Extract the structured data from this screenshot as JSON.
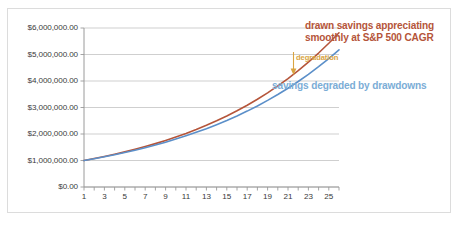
{
  "chart_data": {
    "type": "line",
    "title": "",
    "xlabel": "",
    "ylabel": "",
    "xlim": [
      1,
      26
    ],
    "ylim": [
      0,
      6000000
    ],
    "grid": true,
    "legend_position": "none",
    "y_ticks": [
      0,
      1000000,
      2000000,
      3000000,
      4000000,
      5000000,
      6000000
    ],
    "y_tick_labels": [
      "$0.00",
      "$1,000,000.00",
      "$2,000,000.00",
      "$3,000,000.00",
      "$4,000,000.00",
      "$5,000,000.00",
      "$6,000,000.00"
    ],
    "x_ticks": [
      1,
      2,
      3,
      4,
      5,
      6,
      7,
      8,
      9,
      10,
      11,
      12,
      13,
      14,
      15,
      16,
      17,
      18,
      19,
      20,
      21,
      22,
      23,
      24,
      25,
      26
    ],
    "x_tick_labels": [
      "1",
      "3",
      "5",
      "7",
      "9",
      "11",
      "13",
      "15",
      "17",
      "19",
      "21",
      "23",
      "25"
    ],
    "x_tick_label_values": [
      1,
      3,
      5,
      7,
      9,
      11,
      13,
      15,
      17,
      19,
      21,
      23,
      25
    ],
    "series": [
      {
        "name": "drawn savings appreciating smoothly at S&P 500 CAGR",
        "color": "#b5553a",
        "x": [
          1,
          2,
          3,
          4,
          5,
          6,
          7,
          8,
          9,
          10,
          11,
          12,
          13,
          14,
          15,
          16,
          17,
          18,
          19,
          20,
          21,
          22,
          23,
          24,
          25,
          26
        ],
        "values": [
          1000000,
          1073000,
          1151300,
          1235300,
          1325500,
          1422200,
          1526000,
          1637400,
          1757000,
          1885300,
          2023000,
          2170600,
          2329000,
          2499000,
          2681400,
          2877200,
          3087200,
          3312500,
          3554300,
          3813700,
          4092100,
          4390800,
          4711300,
          5055200,
          5424200,
          5820100
        ]
      },
      {
        "name": "savings degraded by drawdowns",
        "color": "#5b8fc9",
        "x": [
          1,
          2,
          3,
          4,
          5,
          6,
          7,
          8,
          9,
          10,
          11,
          12,
          13,
          14,
          15,
          16,
          17,
          18,
          19,
          20,
          21,
          22,
          23,
          24,
          25,
          26
        ],
        "values": [
          1000000,
          1068000,
          1140600,
          1218200,
          1301000,
          1389500,
          1483900,
          1584800,
          1692500,
          1807600,
          1930500,
          2061700,
          2201900,
          2351600,
          2511500,
          2682300,
          2864700,
          3059400,
          3267400,
          3489500,
          3726800,
          3980200,
          4250700,
          4539600,
          4848000,
          5177000
        ]
      }
    ],
    "annotations": [
      {
        "id": "drawn-savings",
        "text_line1": "drawn savings appreciating",
        "text_line2": "smoothly at S&P 500 CAGR",
        "color": "#b5553a"
      },
      {
        "id": "degradation",
        "text": "degradation",
        "color": "#d9a441"
      },
      {
        "id": "savings-degraded",
        "text": "savings degraded by drawdowns",
        "color": "#7badd6"
      }
    ],
    "colors": {
      "axis": "#9a9a9a",
      "gridline": "#c9c9c9",
      "tick_text": "#3a3a3a",
      "frame": "#dcdcdc",
      "background": "#ffffff"
    }
  }
}
